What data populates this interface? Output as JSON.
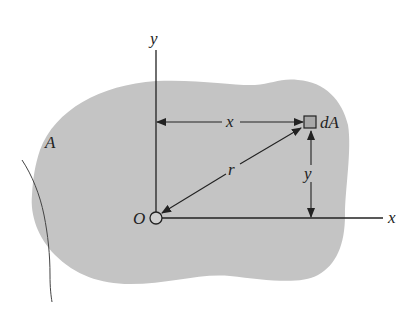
{
  "figure": {
    "region_label": "A",
    "y_axis_label": "y",
    "x_axis_label": "x",
    "origin_label": "O",
    "element_label": "dA",
    "x_distance_label": "x",
    "y_distance_label": "y",
    "radius_label": "r"
  },
  "colors": {
    "region_fill": "#c4c4c4",
    "line": "#222222",
    "element_fill": "#a8a8a8"
  }
}
